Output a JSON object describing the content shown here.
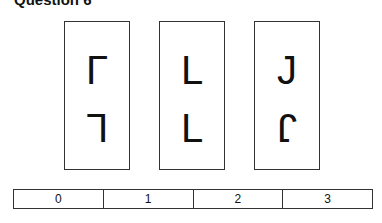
{
  "title": "Question 6",
  "cards": [
    {
      "top": "L",
      "top_transform": "rot180-flipv",
      "bottom": "L",
      "bottom_transform": "flipv-fliph"
    },
    {
      "top": "L",
      "top_transform": "none",
      "bottom": "L",
      "bottom_transform": "none"
    },
    {
      "top": "J",
      "top_transform": "none",
      "bottom": "J",
      "bottom_transform": "rot180"
    }
  ],
  "answer_options": [
    "0",
    "1",
    "2",
    "3"
  ]
}
